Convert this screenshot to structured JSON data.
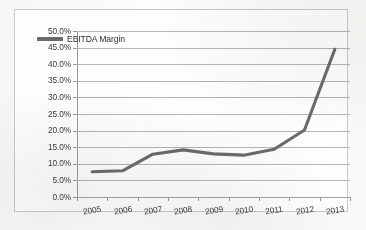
{
  "chart_data": {
    "type": "line",
    "title": "",
    "xlabel": "",
    "ylabel": "",
    "categories": [
      "2005",
      "2006",
      "2007",
      "2008",
      "2009",
      "2010",
      "2011",
      "2012",
      "2013"
    ],
    "series": [
      {
        "name": "EBITDA Margin",
        "color": "#6b6b6b",
        "values": [
          7.6,
          7.9,
          12.9,
          14.2,
          13.0,
          12.6,
          14.4,
          20.2,
          44.5
        ]
      }
    ],
    "ylim": [
      0,
      50
    ],
    "ytick_step": 5,
    "ytick_labels": [
      "0.0%",
      "5.0%",
      "10.0%",
      "15.0%",
      "20.0%",
      "25.0%",
      "30.0%",
      "35.0%",
      "40.0%",
      "45.0%",
      "50.0%"
    ],
    "ytick_values": [
      0,
      5,
      10,
      15,
      20,
      25,
      30,
      35,
      40,
      45,
      50
    ],
    "grid": true,
    "legend_position": "top-left",
    "legend_entries": [
      "EBITDA Margin"
    ],
    "annotations": []
  },
  "figure": {
    "border_color": "#c9c9c7",
    "background": "#fefefd",
    "gridline_color": "#b5b5b3",
    "axis_color": "#9a9a98",
    "label_color": "#3a3a38"
  }
}
